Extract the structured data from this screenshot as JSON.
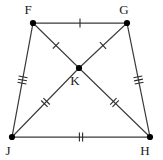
{
  "figure": {
    "kind": "geometry-diagram",
    "shape": "trapezoid-with-diagonals",
    "background_color": "#ffffff",
    "stroke_color": "#3a3a3a",
    "label_color": "#1a1a1a",
    "width": 163,
    "height": 160
  },
  "vertices": [
    {
      "id": "F",
      "label": "F",
      "x": 33,
      "y": 23,
      "label_x": 28,
      "label_y": 14
    },
    {
      "id": "G",
      "label": "G",
      "x": 127,
      "y": 23,
      "label_x": 124,
      "label_y": 14
    },
    {
      "id": "J",
      "label": "J",
      "x": 12,
      "y": 137,
      "label_x": 8,
      "label_y": 155
    },
    {
      "id": "H",
      "label": "H",
      "x": 150,
      "y": 137,
      "label_x": 145,
      "label_y": 155
    },
    {
      "id": "K",
      "label": "K",
      "x": 79,
      "y": 68,
      "label_x": 75,
      "label_y": 85
    }
  ],
  "segments": [
    {
      "id": "FG",
      "from": "F",
      "to": "G",
      "role": "side",
      "ticks": 1,
      "tick_at": 0.5
    },
    {
      "id": "GH",
      "from": "G",
      "to": "H",
      "role": "side",
      "ticks": 3,
      "tick_at": 0.5
    },
    {
      "id": "JH",
      "from": "J",
      "to": "H",
      "role": "side",
      "ticks": 2,
      "tick_at": 0.5
    },
    {
      "id": "FJ",
      "from": "F",
      "to": "J",
      "role": "side",
      "ticks": 3,
      "tick_at": 0.5
    },
    {
      "id": "FK",
      "from": "F",
      "to": "K",
      "role": "diagonal",
      "ticks": 1,
      "tick_at": 0.5
    },
    {
      "id": "KH",
      "from": "K",
      "to": "H",
      "role": "diagonal",
      "ticks": 2,
      "tick_at": 0.5
    },
    {
      "id": "GK",
      "from": "G",
      "to": "K",
      "role": "diagonal",
      "ticks": 1,
      "tick_at": 0.5
    },
    {
      "id": "KJ",
      "from": "K",
      "to": "J",
      "role": "diagonal",
      "ticks": 2,
      "tick_at": 0.5
    }
  ],
  "tick_style": {
    "length": 9,
    "spacing": 3.2
  },
  "vertex_dot": {
    "radius": 3.1
  }
}
